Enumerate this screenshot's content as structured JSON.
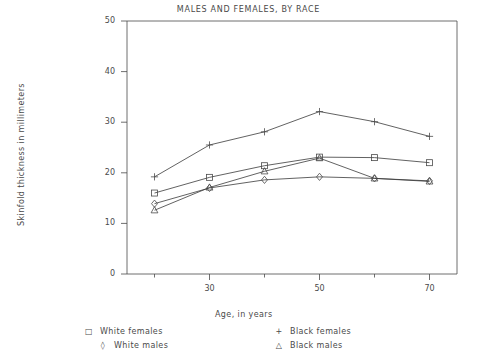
{
  "chart_data": {
    "type": "line",
    "title": "MALES AND FEMALES, BY RACE",
    "xlabel": "Age, in years",
    "ylabel": "Skinfold thickness in millimeters",
    "x": [
      20,
      30,
      40,
      50,
      60,
      70
    ],
    "xlim": [
      15,
      75
    ],
    "ylim": [
      0,
      50
    ],
    "xticks": [
      30,
      50,
      70
    ],
    "xtick_labels": [
      "30",
      "50",
      "70"
    ],
    "xminor_ticks": [
      20,
      40,
      60
    ],
    "yticks": [
      0,
      10,
      20,
      30,
      40,
      50
    ],
    "ytick_labels": [
      "0",
      "10",
      "20",
      "30",
      "40",
      "50"
    ],
    "grid": false,
    "legend_position": "below-axes",
    "series": [
      {
        "name": "White females",
        "marker": "square",
        "symbol": "□",
        "color": "#3a3a3a",
        "values": [
          16.0,
          19.1,
          21.4,
          23.1,
          23.0,
          22.0
        ]
      },
      {
        "name": "White males",
        "marker": "diamond",
        "symbol": "◊",
        "color": "#3a3a3a",
        "values": [
          13.9,
          17.0,
          18.6,
          19.2,
          18.9,
          18.4
        ]
      },
      {
        "name": "Black females",
        "marker": "plus",
        "symbol": "+",
        "color": "#3a3a3a",
        "values": [
          19.2,
          25.5,
          28.1,
          32.1,
          30.1,
          27.2
        ]
      },
      {
        "name": "Black males",
        "marker": "triangle",
        "symbol": "△",
        "color": "#3a3a3a",
        "values": [
          12.6,
          17.1,
          20.3,
          22.9,
          18.9,
          18.3
        ]
      }
    ]
  },
  "legend": {
    "items": [
      {
        "symbol": "□",
        "label": "White females"
      },
      {
        "symbol": "◊",
        "label": "White males"
      },
      {
        "symbol": "+",
        "label": "Black females"
      },
      {
        "symbol": "△",
        "label": "Black males"
      }
    ]
  }
}
